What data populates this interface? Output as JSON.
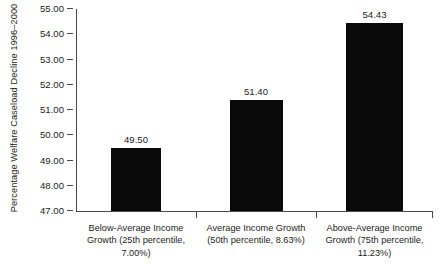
{
  "chart_data": {
    "type": "bar",
    "title": "",
    "xlabel": "",
    "ylabel": "Percentage Welfare Caseload Decline 1996–2000",
    "ylim": [
      47.0,
      55.0
    ],
    "ytick_step": 1.0,
    "ytick_labels": [
      "55.00",
      "54.00",
      "53.00",
      "52.00",
      "51.00",
      "50.00",
      "49.00",
      "48.00",
      "47.00"
    ],
    "ytick_values": [
      55.0,
      54.0,
      53.0,
      52.0,
      51.0,
      50.0,
      49.0,
      48.0,
      47.0
    ],
    "grid": false,
    "legend": "none",
    "bar_color": "#0a0a0a",
    "axis_color": "#4a4a4a",
    "categories": [
      "Below-Average Income Growth (25th percentile, 7.00%)",
      "Average Income Growth (50th percentile, 8.63%)",
      "Above-Average Income Growth (75th percentile, 11.23%)"
    ],
    "category_lines": [
      [
        "Below-Average Income",
        "Growth (25th percentile,",
        "7.00%)"
      ],
      [
        "Average Income Growth",
        "(50th percentile, 8.63%)",
        ""
      ],
      [
        "Above-Average Income",
        "Growth (75th percentile,",
        "11.23%)"
      ]
    ],
    "values": [
      49.5,
      51.4,
      54.43
    ],
    "value_labels": [
      "49.50",
      "51.40",
      "54.43"
    ]
  }
}
